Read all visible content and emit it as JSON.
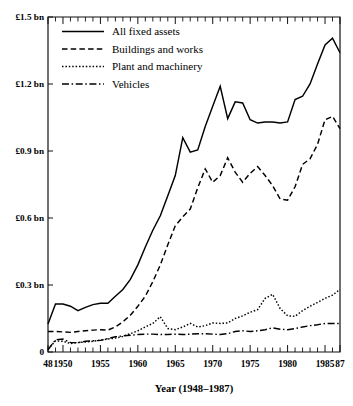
{
  "chart_data": {
    "type": "line",
    "title": "",
    "xlabel": "Year (1948–1987)",
    "ylabel": "",
    "xlim": [
      1948,
      1987
    ],
    "ylim": [
      0,
      1.5
    ],
    "grid": false,
    "legend_position": "top-left",
    "y_tick_labels": [
      "£1.5 bn",
      "£1.2 bn",
      "£0.9 bn",
      "£0.6 bn",
      "£0.3 bn",
      "0"
    ],
    "y_tick_values": [
      1.5,
      1.2,
      0.9,
      0.6,
      0.3,
      0
    ],
    "x_tick_labels": [
      "48",
      "1950",
      "1955",
      "1960",
      "1965",
      "1970",
      "1975",
      "1980",
      "1985",
      "87"
    ],
    "x_tick_values": [
      1948,
      1950,
      1955,
      1960,
      1965,
      1970,
      1975,
      1980,
      1985,
      1987
    ],
    "x": [
      1948,
      1949,
      1950,
      1951,
      1952,
      1953,
      1954,
      1955,
      1956,
      1957,
      1958,
      1959,
      1960,
      1961,
      1962,
      1963,
      1964,
      1965,
      1966,
      1967,
      1968,
      1969,
      1970,
      1971,
      1972,
      1973,
      1974,
      1975,
      1976,
      1977,
      1978,
      1979,
      1980,
      1981,
      1982,
      1983,
      1984,
      1985,
      1986,
      1987
    ],
    "series": [
      {
        "name": "All fixed assets",
        "style": "solid",
        "values": [
          0.125,
          0.215,
          0.215,
          0.205,
          0.185,
          0.2,
          0.212,
          0.218,
          0.218,
          0.25,
          0.28,
          0.325,
          0.39,
          0.47,
          0.545,
          0.61,
          0.7,
          0.79,
          0.96,
          0.895,
          0.905,
          1.01,
          1.1,
          1.19,
          1.045,
          1.12,
          1.115,
          1.04,
          1.025,
          1.03,
          1.03,
          1.025,
          1.03,
          1.13,
          1.145,
          1.2,
          1.29,
          1.375,
          1.405,
          1.34
        ]
      },
      {
        "name": "Buildings and works",
        "style": "dashed",
        "values": [
          0.092,
          0.092,
          0.09,
          0.088,
          0.092,
          0.095,
          0.098,
          0.1,
          0.098,
          0.112,
          0.135,
          0.165,
          0.205,
          0.25,
          0.315,
          0.39,
          0.48,
          0.565,
          0.605,
          0.64,
          0.735,
          0.82,
          0.76,
          0.79,
          0.87,
          0.805,
          0.76,
          0.8,
          0.83,
          0.79,
          0.745,
          0.685,
          0.68,
          0.74,
          0.84,
          0.865,
          0.93,
          1.04,
          1.055,
          1.0
        ]
      },
      {
        "name": "Plant and machinery",
        "style": "dotted",
        "values": [
          0.012,
          0.05,
          0.048,
          0.038,
          0.042,
          0.045,
          0.048,
          0.053,
          0.058,
          0.062,
          0.07,
          0.082,
          0.095,
          0.112,
          0.128,
          0.158,
          0.105,
          0.1,
          0.112,
          0.128,
          0.112,
          0.118,
          0.13,
          0.128,
          0.13,
          0.15,
          0.162,
          0.178,
          0.19,
          0.24,
          0.258,
          0.195,
          0.162,
          0.16,
          0.185,
          0.205,
          0.222,
          0.24,
          0.255,
          0.28
        ]
      },
      {
        "name": "Vehicles",
        "style": "dashdot",
        "values": [
          0.01,
          0.055,
          0.058,
          0.042,
          0.042,
          0.048,
          0.05,
          0.052,
          0.06,
          0.068,
          0.072,
          0.075,
          0.078,
          0.08,
          0.08,
          0.078,
          0.078,
          0.08,
          0.078,
          0.08,
          0.082,
          0.082,
          0.08,
          0.078,
          0.082,
          0.092,
          0.095,
          0.092,
          0.095,
          0.1,
          0.108,
          0.102,
          0.1,
          0.105,
          0.112,
          0.118,
          0.122,
          0.128,
          0.128,
          0.128
        ]
      }
    ]
  },
  "legend": {
    "items": [
      {
        "label": "All fixed assets",
        "style": "solid"
      },
      {
        "label": "Buildings and works",
        "style": "dashed"
      },
      {
        "label": "Plant and machinery",
        "style": "dotted"
      },
      {
        "label": "Vehicles",
        "style": "dashdot"
      }
    ]
  },
  "colors": {
    "ink": "#000000",
    "background": "#ffffff"
  }
}
